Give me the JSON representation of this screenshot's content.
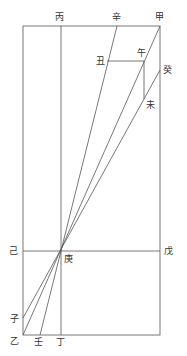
{
  "diagram": {
    "type": "geometric-construction",
    "stroke_color": "#555555",
    "background": "#ffffff",
    "points": {
      "jia": {
        "label": "甲",
        "x": 160,
        "y": 26,
        "lx": 155,
        "ly": 20
      },
      "xin": {
        "label": "辛",
        "x": 117,
        "y": 26,
        "lx": 112,
        "ly": 20
      },
      "bing": {
        "label": "丙",
        "x": 61,
        "y": 26,
        "lx": 55,
        "ly": 20
      },
      "chou": {
        "label": "丑",
        "x": 107,
        "y": 61,
        "lx": 96,
        "ly": 64
      },
      "wu": {
        "label": "午",
        "x": 144,
        "y": 61,
        "lx": 137,
        "ly": 56
      },
      "gui": {
        "label": "癸",
        "x": 160,
        "y": 70,
        "lx": 163,
        "ly": 73
      },
      "wei": {
        "label": "未",
        "x": 144,
        "y": 99,
        "lx": 146,
        "ly": 108
      },
      "ji": {
        "label": "己",
        "x": 23,
        "y": 251,
        "lx": 9,
        "ly": 254
      },
      "wu2": {
        "label": "戊",
        "x": 160,
        "y": 251,
        "lx": 164,
        "ly": 254
      },
      "geng": {
        "label": "庚",
        "x": 61,
        "y": 251,
        "lx": 64,
        "ly": 262
      },
      "zi": {
        "label": "子",
        "x": 23,
        "y": 318,
        "lx": 10,
        "ly": 322
      },
      "yi": {
        "label": "乙",
        "x": 23,
        "y": 335,
        "lx": 10,
        "ly": 344
      },
      "ren": {
        "label": "壬",
        "x": 40,
        "y": 335,
        "lx": 34,
        "ly": 345
      },
      "ding": {
        "label": "丁",
        "x": 61,
        "y": 335,
        "lx": 56,
        "ly": 345
      }
    }
  }
}
